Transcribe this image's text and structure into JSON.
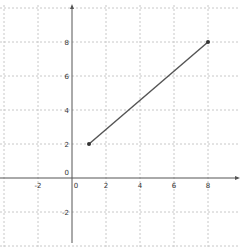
{
  "chart_data": {
    "type": "line",
    "title": "",
    "xlabel": "",
    "ylabel": "",
    "series": [
      {
        "name": "segment",
        "points": [
          [
            1,
            2
          ],
          [
            8,
            8
          ]
        ]
      }
    ],
    "x_ticks": [
      -2,
      0,
      2,
      4,
      6,
      8
    ],
    "y_ticks": [
      -2,
      2,
      4,
      6,
      8
    ],
    "origin_label": "0",
    "xlim": [
      -4.2,
      9.8
    ],
    "ylim": [
      -4,
      10.2
    ],
    "grid": true,
    "legend": "none"
  },
  "view": {
    "origin_px": [
      72,
      178
    ],
    "unit_px": 17,
    "colors": {
      "axis": "#555555",
      "grid": "#c8c8c8",
      "line": "#555555",
      "point": "#333333",
      "label": "#333333"
    }
  }
}
